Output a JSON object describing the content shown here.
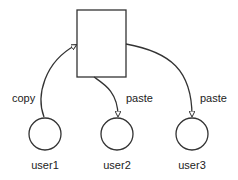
{
  "diagram": {
    "nodes": [
      {
        "id": "clipboard",
        "shape": "rectangle",
        "label": ""
      },
      {
        "id": "user1",
        "shape": "circle",
        "label": "user1"
      },
      {
        "id": "user2",
        "shape": "circle",
        "label": "user2"
      },
      {
        "id": "user3",
        "shape": "circle",
        "label": "user3"
      }
    ],
    "edges": [
      {
        "from": "user1",
        "to": "clipboard",
        "label": "copy"
      },
      {
        "from": "clipboard",
        "to": "user2",
        "label": "paste"
      },
      {
        "from": "clipboard",
        "to": "user3",
        "label": "paste"
      }
    ],
    "colors": {
      "stroke": "#333333",
      "text": "#222222",
      "background": "#ffffff"
    }
  }
}
